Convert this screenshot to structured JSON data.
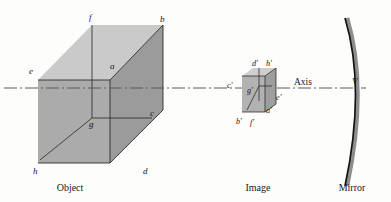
{
  "figure": {
    "type": "optics-ray-diagram",
    "background_color": "#fdfdfc"
  },
  "captions": {
    "object": "Object",
    "image": "Image",
    "mirror": "Mirror"
  },
  "axis": {
    "label": "Axis",
    "vertex_label": "V",
    "style": "dash-dot",
    "color": "#5a5a5a",
    "y": 88
  },
  "object": {
    "name": "Object",
    "fill_front": "#a9a9a9",
    "fill_top": "#c9c9c9",
    "fill_side": "#9a9a9a",
    "edge_color": "#2b2b2b",
    "vertices": [
      {
        "id": "a",
        "label": "a",
        "x": 113,
        "y": 66
      },
      {
        "id": "b",
        "label": "b",
        "x": 163,
        "y": 21
      },
      {
        "id": "c",
        "label": "c",
        "x": 152,
        "y": 112
      },
      {
        "id": "d",
        "label": "d",
        "x": 146,
        "y": 158
      },
      {
        "id": "e",
        "label": "e",
        "x": 32,
        "y": 71
      },
      {
        "id": "f",
        "label": "f",
        "x": 92,
        "y": 17
      },
      {
        "id": "g",
        "label": "g",
        "x": 93,
        "y": 118
      },
      {
        "id": "h",
        "label": "h",
        "x": 38,
        "y": 158
      }
    ]
  },
  "image": {
    "name": "Image",
    "fill_front": "#b0b0b0",
    "fill_top": "#cccccc",
    "fill_side": "#9c9c9c",
    "edge_color": "#2b2b2b",
    "vertices": [
      {
        "id": "a_prime",
        "label": "a′",
        "x": 270,
        "y": 106
      },
      {
        "id": "b_prime",
        "label": "b′",
        "x": 241,
        "y": 116
      },
      {
        "id": "c_prime",
        "label": "c′",
        "x": 232,
        "y": 85
      },
      {
        "id": "d_prime",
        "label": "d′",
        "x": 257,
        "y": 62
      },
      {
        "id": "e_prime",
        "label": "e′",
        "x": 278,
        "y": 97
      },
      {
        "id": "f_prime",
        "label": "f′",
        "x": 254,
        "y": 118
      },
      {
        "id": "g_prime",
        "label": "g′",
        "x": 251,
        "y": 89
      },
      {
        "id": "h_prime",
        "label": "h′",
        "x": 269,
        "y": 62
      }
    ]
  },
  "mirror": {
    "name": "Mirror",
    "shape": "concave-arc",
    "line_color": "#151515",
    "band_color": "#8e8e8e",
    "vertex_x": 359,
    "vertex_y": 88
  }
}
